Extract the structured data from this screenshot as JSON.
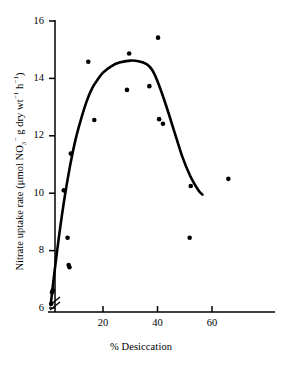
{
  "chart_data": {
    "type": "scatter",
    "title": "",
    "xlabel": "% Desiccation",
    "ylabel": "Nitrate uptake rate (μmol NO3- g dry wt-1 h-1)",
    "ylabel_parts": {
      "lead": "Nitrate uptake rate (μmol NO",
      "sub3": "3",
      "supminus": "−",
      "mid": " g dry wt",
      "sup1a": "−1",
      "mid2": " h",
      "sup1b": "−1",
      "tail": ")"
    },
    "xlim": [
      0,
      78
    ],
    "ylim": [
      6,
      16
    ],
    "xticks": [
      20,
      40,
      60
    ],
    "yticks": [
      6,
      8,
      10,
      12,
      14,
      16
    ],
    "xtick_labels": [
      "20",
      "40",
      "60"
    ],
    "ytick_labels": [
      "6",
      "8",
      "10",
      "12",
      "14",
      "16"
    ],
    "grid": false,
    "legend": "none",
    "axis_break": {
      "axis": "y",
      "at": 6.3,
      "style": "double-slash"
    },
    "marker": {
      "shape": "circle",
      "color": "#000000",
      "size": 4.6
    },
    "points": [
      {
        "x": 1.0,
        "y": 6.15
      },
      {
        "x": 1.3,
        "y": 6.55
      },
      {
        "x": 1.6,
        "y": 6.62
      },
      {
        "x": 5.6,
        "y": 10.1
      },
      {
        "x": 7.0,
        "y": 8.45
      },
      {
        "x": 7.4,
        "y": 7.5
      },
      {
        "x": 7.7,
        "y": 7.42
      },
      {
        "x": 8.2,
        "y": 11.38
      },
      {
        "x": 14.6,
        "y": 14.58
      },
      {
        "x": 16.8,
        "y": 12.55
      },
      {
        "x": 28.8,
        "y": 13.6
      },
      {
        "x": 29.6,
        "y": 14.87
      },
      {
        "x": 37.0,
        "y": 13.73
      },
      {
        "x": 40.2,
        "y": 15.42
      },
      {
        "x": 40.6,
        "y": 12.58
      },
      {
        "x": 42.0,
        "y": 12.42
      },
      {
        "x": 51.8,
        "y": 8.45
      },
      {
        "x": 52.2,
        "y": 10.25
      },
      {
        "x": 66.0,
        "y": 10.5
      }
    ],
    "fit_curve": {
      "name": "fitted trend line",
      "style": "solid",
      "color": "#000000",
      "width": 2.6,
      "points": [
        {
          "x": 0.8,
          "y": 6.1
        },
        {
          "x": 2.0,
          "y": 7.1
        },
        {
          "x": 4.0,
          "y": 8.6
        },
        {
          "x": 6.0,
          "y": 9.9
        },
        {
          "x": 8.0,
          "y": 11.0
        },
        {
          "x": 10.0,
          "y": 11.9
        },
        {
          "x": 12.0,
          "y": 12.6
        },
        {
          "x": 14.0,
          "y": 13.2
        },
        {
          "x": 16.0,
          "y": 13.65
        },
        {
          "x": 18.0,
          "y": 13.95
        },
        {
          "x": 20.0,
          "y": 14.2
        },
        {
          "x": 23.0,
          "y": 14.42
        },
        {
          "x": 26.0,
          "y": 14.55
        },
        {
          "x": 30.0,
          "y": 14.62
        },
        {
          "x": 33.0,
          "y": 14.6
        },
        {
          "x": 36.0,
          "y": 14.5
        },
        {
          "x": 38.0,
          "y": 14.3
        },
        {
          "x": 40.0,
          "y": 13.9
        },
        {
          "x": 43.0,
          "y": 13.1
        },
        {
          "x": 46.0,
          "y": 12.2
        },
        {
          "x": 49.0,
          "y": 11.3
        },
        {
          "x": 52.0,
          "y": 10.6
        },
        {
          "x": 55.0,
          "y": 10.1
        },
        {
          "x": 56.5,
          "y": 9.95
        }
      ]
    }
  }
}
